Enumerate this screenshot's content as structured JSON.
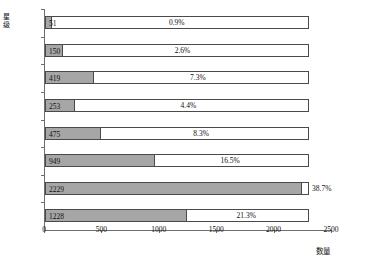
{
  "chart_data": {
    "type": "bar",
    "orientation": "horizontal",
    "title": "",
    "xlabel": "数量",
    "ylabel": "星级",
    "xlim": [
      0,
      2500
    ],
    "ylim": null,
    "grid": false,
    "legend": null,
    "xticks": [
      "0",
      "500",
      "1000",
      "1500",
      "2000",
      "2500"
    ],
    "xtick_values": [
      0,
      500,
      1000,
      1500,
      2000,
      2500
    ],
    "categories": [
      "5星",
      "4.5星",
      "4星",
      "3.5星",
      "3星",
      "2.5星",
      "2星",
      "1星"
    ],
    "values": [
      51,
      150,
      419,
      253,
      475,
      949,
      2229,
      1228
    ],
    "value_labels": [
      "51",
      "150",
      "419",
      "253",
      "475",
      "949",
      "2229",
      "1228"
    ],
    "percent_labels": [
      "0.9%",
      "2.6%",
      "7.3%",
      "4.4%",
      "8.3%",
      "16.5%",
      "38.7%",
      "21.3%"
    ],
    "percents": [
      0.9,
      2.6,
      7.3,
      4.4,
      8.3,
      16.5,
      38.7,
      21.3
    ],
    "outline_total": 2300,
    "colors": {
      "bar_fill": "#a6a6a6",
      "bar_edge": "#4a4a4a",
      "axis": "#6e6e6e",
      "text": "#111111",
      "background": "#ffffff"
    }
  }
}
